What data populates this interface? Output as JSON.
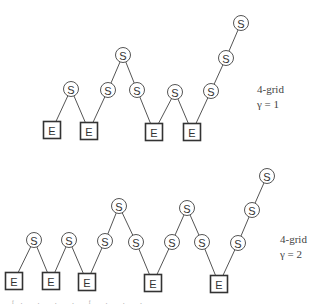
{
  "diagrams": [
    {
      "id": "top",
      "label_line1": "4-grid",
      "label_line2": "γ = 1",
      "label_pos": {
        "x": 257,
        "y": 82
      },
      "node_text": {
        "S": "S",
        "E": "E"
      },
      "nodes": [
        {
          "type": "E",
          "x": 52,
          "y": 130
        },
        {
          "type": "S",
          "x": 71,
          "y": 89
        },
        {
          "type": "E",
          "x": 89,
          "y": 131
        },
        {
          "type": "S",
          "x": 108,
          "y": 90
        },
        {
          "type": "S",
          "x": 123,
          "y": 55
        },
        {
          "type": "S",
          "x": 137,
          "y": 90
        },
        {
          "type": "E",
          "x": 154,
          "y": 132
        },
        {
          "type": "S",
          "x": 175,
          "y": 92
        },
        {
          "type": "E",
          "x": 192,
          "y": 132
        },
        {
          "type": "S",
          "x": 211,
          "y": 91
        },
        {
          "type": "S",
          "x": 226,
          "y": 58
        },
        {
          "type": "S",
          "x": 241,
          "y": 23
        }
      ]
    },
    {
      "id": "bottom",
      "label_line1": "4-grid",
      "label_line2": "γ = 2",
      "label_pos": {
        "x": 280,
        "y": 232
      },
      "node_text": {
        "S": "S",
        "E": "E"
      },
      "nodes": [
        {
          "type": "E",
          "x": 14,
          "y": 281
        },
        {
          "type": "S",
          "x": 34,
          "y": 240
        },
        {
          "type": "E",
          "x": 51,
          "y": 281
        },
        {
          "type": "S",
          "x": 69,
          "y": 240
        },
        {
          "type": "E",
          "x": 87,
          "y": 282
        },
        {
          "type": "S",
          "x": 105,
          "y": 241
        },
        {
          "type": "S",
          "x": 119,
          "y": 206
        },
        {
          "type": "S",
          "x": 136,
          "y": 242
        },
        {
          "type": "E",
          "x": 153,
          "y": 283
        },
        {
          "type": "S",
          "x": 172,
          "y": 242
        },
        {
          "type": "S",
          "x": 187,
          "y": 208
        },
        {
          "type": "S",
          "x": 202,
          "y": 242
        },
        {
          "type": "E",
          "x": 219,
          "y": 284
        },
        {
          "type": "S",
          "x": 238,
          "y": 243
        },
        {
          "type": "S",
          "x": 252,
          "y": 210
        },
        {
          "type": "S",
          "x": 267,
          "y": 176
        }
      ]
    }
  ],
  "caption_fragment": "ᶠ· · · · ᶠ · · ·",
  "style": {
    "edge_color": "#555555",
    "node_stroke": "#555555",
    "box_stroke": "#333333",
    "background": "#ffffff"
  }
}
